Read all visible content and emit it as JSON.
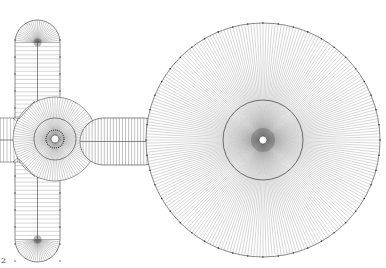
{
  "figure": {
    "label": "2",
    "stroke_color": "#3a3a3a",
    "light_stroke_color": "#8a8a8a",
    "background": "#ffffff"
  },
  "shapes": {
    "large_disc": {
      "cx": 263,
      "cy": 140,
      "r": 117,
      "inner_r": 40,
      "hub_r": 4,
      "spokes": 240,
      "ticks": 48
    },
    "small_hub": {
      "cx": 55,
      "cy": 139,
      "r": 21,
      "outer_r": 42,
      "hub_r": 4,
      "spokes": 96
    },
    "vertical_capsule": {
      "x": 15,
      "y": 20,
      "w": 45,
      "h": 242,
      "cap_r": 22.5,
      "stripes": 48,
      "spokes": 30
    },
    "horizontal_capsule": {
      "x": 80,
      "y": 118,
      "w": 87,
      "h": 47,
      "cap_r": 23.5,
      "stripes": 28
    },
    "left_bar": {
      "x": 0,
      "y": 118,
      "w": 35,
      "h": 44,
      "stripes": 10
    }
  }
}
